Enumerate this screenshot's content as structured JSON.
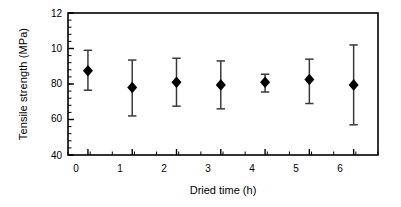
{
  "chart_data": {
    "type": "scatter",
    "title": "",
    "xlabel": "Dried time (h)",
    "ylabel": "Tensile strength  (MPa)",
    "x": [
      0,
      1,
      2,
      3,
      4,
      5,
      6
    ],
    "xticklabels": [
      "0",
      "1",
      "2",
      "3",
      "4",
      "5",
      "6"
    ],
    "yticklabels": [
      "40",
      "60",
      "80",
      "10",
      "12"
    ],
    "ytickvalues": [
      40,
      60,
      80,
      100,
      120
    ],
    "xlim": [
      -0.45,
      6.55
    ],
    "ylim": [
      40,
      120
    ],
    "grid": false,
    "legend": null,
    "marker": "filled-diamond",
    "errorbars": true,
    "series": [
      {
        "name": "Tensile strength",
        "values": [
          87.5,
          78.0,
          81.0,
          79.5,
          81.0,
          82.5,
          79.5
        ],
        "err_upper": [
          11.5,
          15.5,
          13.5,
          13.5,
          4.5,
          11.5,
          22.5
        ],
        "err_lower": [
          11.0,
          16.0,
          13.5,
          13.5,
          5.5,
          13.5,
          22.5
        ],
        "upper_abs": [
          99.0,
          93.5,
          94.5,
          93.0,
          85.5,
          94.0,
          102.0
        ],
        "lower_abs": [
          76.5,
          62.0,
          67.5,
          66.0,
          75.5,
          69.0,
          57.0
        ]
      }
    ],
    "minor_ticks_x": 1,
    "minor_ticks_y": 4,
    "axis_color": "#000000",
    "marker_color": "#000000",
    "error_color": "#3a3a3a",
    "plot_background": "#ffffff"
  }
}
